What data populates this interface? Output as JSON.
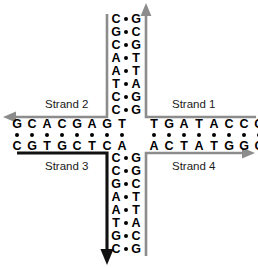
{
  "figure": {
    "colors": {
      "gray_strand": "#8c8c8c",
      "black_strand": "#111111",
      "base_text": "#000000",
      "bond_dot": "#000000",
      "background": "#ffffff",
      "label_text": "#1a1a1a"
    }
  },
  "labels": {
    "strand1": "Strand 1",
    "strand2": "Strand 2",
    "strand3": "Strand 3",
    "strand4": "Strand 4"
  },
  "arms": {
    "top": {
      "name": "top-arm",
      "left_column": [
        "C",
        "G",
        "C",
        "A",
        "A",
        "T",
        "C",
        "C"
      ],
      "right_column": [
        "G",
        "C",
        "G",
        "T",
        "T",
        "A",
        "G",
        "G"
      ]
    },
    "bottom": {
      "name": "bottom-arm",
      "left_column": [
        "C",
        "C",
        "G",
        "A",
        "A",
        "T",
        "G",
        "C"
      ],
      "right_column": [
        "G",
        "G",
        "C",
        "T",
        "T",
        "A",
        "C",
        "G"
      ]
    },
    "left": {
      "name": "left-arm",
      "top_row": [
        "G",
        "C",
        "A",
        "C",
        "G",
        "A",
        "G",
        "T"
      ],
      "bottom_row": [
        "C",
        "G",
        "T",
        "G",
        "C",
        "T",
        "C",
        "A"
      ]
    },
    "right": {
      "name": "right-arm",
      "top_row": [
        "T",
        "G",
        "A",
        "T",
        "A",
        "C",
        "C",
        "G"
      ],
      "bottom_row": [
        "A",
        "C",
        "T",
        "A",
        "T",
        "G",
        "G",
        "C"
      ]
    }
  },
  "strand_paths": {
    "strand1": {
      "color": "#8c8c8c",
      "arrow": "up",
      "icon": "arrowhead-up-icon"
    },
    "strand2": {
      "color": "#8c8c8c",
      "arrow": "left",
      "icon": "arrowhead-left-icon"
    },
    "strand3": {
      "color": "#111111",
      "arrow": "down",
      "icon": "arrowhead-down-icon"
    },
    "strand4": {
      "color": "#8c8c8c",
      "arrow": "right",
      "icon": "arrowhead-right-icon"
    }
  },
  "geometry": {
    "col_left_x": 116,
    "col_dot_x": 126,
    "col_right_x": 136,
    "top_row_start_y": 19,
    "top_row_step": 13,
    "bottom_row_start_y": 158,
    "bottom_row_step": 13,
    "row_top_y": 124,
    "row_dot_y": 135,
    "row_bottom_y": 146,
    "left_col_start_x": 17,
    "left_col_step": 15,
    "right_col_start_x": 146,
    "right_col_step": 15
  }
}
